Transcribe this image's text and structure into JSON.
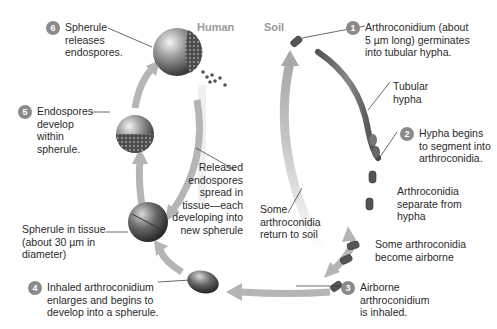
{
  "diagram": {
    "regions": {
      "human": "Human",
      "soil": "Soil"
    },
    "steps": [
      {
        "number": "1",
        "text": "Arthroconidium (about\n5 µm long) germinates\ninto tubular hypha."
      },
      {
        "number": "2",
        "text": "Hypha begins\nto segment into\narthroconidia."
      },
      {
        "number": "3",
        "text": "Airborne\narthroconidium\nis inhaled."
      },
      {
        "number": "4",
        "text": "Inhaled arthroconidium\nenlarges and begins to\ndevelop into a spherule."
      },
      {
        "number": "5",
        "text": "Endospores\ndevelop\nwithin\nspherule."
      },
      {
        "number": "6",
        "text": "Spherule\nreleases\nendospores."
      }
    ],
    "labels": {
      "tubular_hypha": "Tubular\nhypha",
      "arthroconidia_separate": "Arthroconidia\nseparate from\nhypha",
      "become_airborne": "Some arthroconidia\nbecome airborne",
      "return_to_soil": "Some\narthroconidia\nreturn to soil",
      "released_endospores": "Released\nendospores\nspread in\ntissue—each\ndeveloping into\nnew spherule",
      "spherule_in_tissue": "Spherule in tissue\n(about 30 µm in\ndiameter)"
    },
    "colors": {
      "arrow": "#b8b8b8",
      "badge": "#8a8a8a",
      "region_label": "#9a9a9a",
      "text": "#2a2a2a"
    }
  }
}
